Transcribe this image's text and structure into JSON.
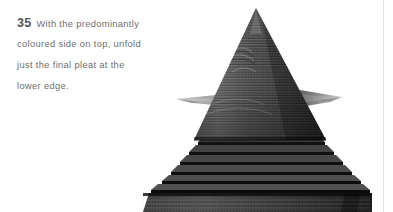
{
  "document": {
    "step_number": "35",
    "instruction_lines": [
      "With the predominantly",
      "coloured side on top, unfold",
      "just the final pleat at the",
      "lower edge."
    ],
    "instruction_full": "With the predominantly coloured side on top, unfold just the final pleat at the lower edge.",
    "text_color": "#6e6e6e",
    "step_number_color": "#575757",
    "background_color": "#ffffff",
    "page_rule_color": "#e2e2e2"
  },
  "figure": {
    "name": "pleated-paper-model-photo",
    "colors": {
      "cone_light": "#6d6d6d",
      "cone_mid": "#4a4a4a",
      "cone_dark": "#2c2c2c",
      "base_light": "#4f4f4f",
      "base_dark": "#141414",
      "wing": "#8c8c8c",
      "shadow": "#0d0d0d"
    },
    "geometry": {
      "apex": [
        256,
        8
      ],
      "cone_base_left": 194,
      "cone_base_right": 326,
      "cone_base_y": 140,
      "wing_y": 98,
      "wing_left_tip": 176,
      "wing_right_tip": 342,
      "base_step_count": 7,
      "base_left": 143,
      "base_right": 372,
      "base_bottom": 212
    }
  }
}
